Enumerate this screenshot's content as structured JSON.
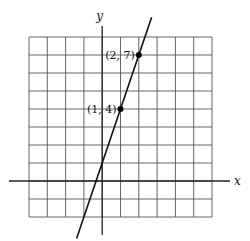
{
  "chart_data": {
    "type": "line",
    "title": "",
    "xlabel": "x",
    "ylabel": "y",
    "xlim": [
      -4,
      6
    ],
    "ylim": [
      -2,
      8
    ],
    "grid": true,
    "grid_step": 1,
    "series": [
      {
        "name": "y = 3x + 1",
        "slope": 3,
        "intercept": 1,
        "x_range": [
          -1.4,
          2.7
        ]
      }
    ],
    "points": [
      {
        "x": 1,
        "y": 4,
        "label": "(1, 4)"
      },
      {
        "x": 2,
        "y": 7,
        "label": "(2, 7)"
      }
    ]
  },
  "labels": {
    "x_axis": "x",
    "y_axis": "y",
    "point_1": "(1, 4)",
    "point_2": "(2, 7)"
  },
  "colors": {
    "grid": "#555555",
    "axis": "#222222",
    "line": "#111111",
    "point": "#000000"
  }
}
